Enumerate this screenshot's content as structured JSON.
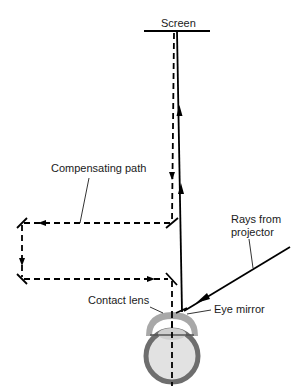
{
  "diagram": {
    "labels": {
      "screen": "Screen",
      "compensating_path": "Compensating path",
      "rays_line1": "Rays from",
      "rays_line2": "projector",
      "contact_lens": "Contact lens",
      "eye_mirror": "Eye mirror"
    },
    "colors": {
      "line": "#000000",
      "lens_outer": "#a8a8a8",
      "lens_inner": "#d0d0d0",
      "eye_ring": "#6e6e6e",
      "eye_fill": "#e2e2e2",
      "background": "#ffffff"
    }
  }
}
